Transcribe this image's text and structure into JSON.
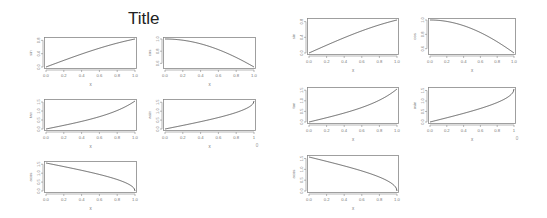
{
  "chart_data": [
    {
      "figure": "left",
      "title": "Title",
      "layout": "3x2 grid of small line plots (5 panels)",
      "panels": [
        {
          "type": "line",
          "xlabel": "x",
          "ylabel": "sin",
          "function": "sin(x)",
          "xlim": [
            0,
            1
          ],
          "ylim": [
            0,
            0.84
          ],
          "xticks": [
            "0.0",
            "0.2",
            "0.4",
            "0.6",
            "0.8",
            "1.0"
          ],
          "yticks": [
            "0.0",
            "0.4",
            "0.8"
          ],
          "x": [
            0,
            0.2,
            0.4,
            0.6,
            0.8,
            1.0
          ],
          "y": [
            0,
            0.199,
            0.389,
            0.565,
            0.717,
            0.841
          ]
        },
        {
          "type": "line",
          "xlabel": "x",
          "ylabel": "cos",
          "function": "cos(x)",
          "xlim": [
            0,
            1
          ],
          "ylim": [
            0.54,
            1
          ],
          "xticks": [
            "0.0",
            "0.2",
            "0.4",
            "0.6",
            "0.8",
            "1.0"
          ],
          "yticks": [
            "0.6",
            "0.8",
            "1.0"
          ],
          "x": [
            0,
            0.2,
            0.4,
            0.6,
            0.8,
            1.0
          ],
          "y": [
            1,
            0.98,
            0.921,
            0.825,
            0.697,
            0.54
          ]
        },
        {
          "type": "line",
          "xlabel": "x",
          "ylabel": "tan",
          "function": "tan(x)",
          "xlim": [
            0,
            1
          ],
          "ylim": [
            0,
            1.56
          ],
          "xticks": [
            "0.0",
            "0.2",
            "0.4",
            "0.6",
            "0.8",
            "1.0"
          ],
          "yticks": [
            "0.0",
            "0.5",
            "1.0",
            "1.5"
          ],
          "x": [
            0,
            0.2,
            0.4,
            0.6,
            0.8,
            1.0
          ],
          "y": [
            0,
            0.203,
            0.423,
            0.684,
            1.03,
            1.557
          ]
        },
        {
          "type": "line",
          "xlabel": "x",
          "ylabel": "asin",
          "function": "asin(x)",
          "xlim": [
            0,
            1
          ],
          "ylim": [
            0,
            1.57
          ],
          "xticks": [
            "0.0",
            "0.2",
            "0.4",
            "0.6",
            "0.8",
            "1"
          ],
          "yticks": [
            "0.0",
            "0.5",
            "1.0",
            "1.5"
          ],
          "x": [
            0,
            0.2,
            0.4,
            0.6,
            0.8,
            0.95,
            1.0
          ],
          "y": [
            0,
            0.201,
            0.412,
            0.644,
            0.927,
            1.253,
            1.571
          ],
          "annotation": "0"
        },
        {
          "type": "line",
          "xlabel": "x",
          "ylabel": "acos",
          "function": "acos(x)",
          "xlim": [
            0,
            1
          ],
          "ylim": [
            0,
            1.57
          ],
          "xticks": [
            "0.0",
            "0.2",
            "0.4",
            "0.6",
            "0.8",
            "1.0"
          ],
          "yticks": [
            "0.0",
            "0.5",
            "1.0",
            "1.5"
          ],
          "x": [
            0,
            0.2,
            0.4,
            0.6,
            0.8,
            0.95,
            1.0
          ],
          "y": [
            1.571,
            1.369,
            1.159,
            0.927,
            0.644,
            0.318,
            0
          ]
        }
      ]
    },
    {
      "figure": "right",
      "title": "",
      "layout": "3x2 grid of small line plots (5 panels)",
      "panels": [
        {
          "type": "line",
          "xlabel": "x",
          "ylabel": "sin",
          "function": "sin(x)"
        },
        {
          "type": "line",
          "xlabel": "x",
          "ylabel": "cos",
          "function": "cos(x)"
        },
        {
          "type": "line",
          "xlabel": "x",
          "ylabel": "tan",
          "function": "tan(x)"
        },
        {
          "type": "line",
          "xlabel": "x",
          "ylabel": "asin",
          "function": "asin(x)",
          "annotation": "0"
        },
        {
          "type": "line",
          "xlabel": "x",
          "ylabel": "acos",
          "function": "acos(x)"
        }
      ]
    }
  ],
  "left": {
    "title": "Title",
    "panels": [
      {
        "ylabel": "sin",
        "xlabel": "x",
        "fn": "sin",
        "ymin": 0,
        "ymax": 0.8415,
        "yticks": [
          [
            0,
            "0.0"
          ],
          [
            0.4,
            "0.4"
          ],
          [
            0.8,
            "0.8"
          ]
        ],
        "xticks": [
          "0.0",
          "0.2",
          "0.4",
          "0.6",
          "0.8",
          "1.0"
        ],
        "x": 44,
        "y": 37,
        "w": 93,
        "h": 32,
        "annot": ""
      },
      {
        "ylabel": "cos",
        "xlabel": "x",
        "fn": "cos",
        "ymin": 0.5403,
        "ymax": 1,
        "yticks": [
          [
            0.6,
            "0.6"
          ],
          [
            0.8,
            "0.8"
          ],
          [
            1.0,
            "1.0"
          ]
        ],
        "xticks": [
          "0.0",
          "0.2",
          "0.4",
          "0.6",
          "0.8",
          "1.0"
        ],
        "x": 163,
        "y": 37,
        "w": 93,
        "h": 32,
        "annot": ""
      },
      {
        "ylabel": "tan",
        "xlabel": "x",
        "fn": "tan",
        "ymin": 0,
        "ymax": 1.5574,
        "yticks": [
          [
            0,
            "0.0"
          ],
          [
            0.5,
            "0.5"
          ],
          [
            1.0,
            "1.0"
          ],
          [
            1.5,
            "1.5"
          ]
        ],
        "xticks": [
          "0.0",
          "0.2",
          "0.4",
          "0.6",
          "0.8",
          "1.0"
        ],
        "x": 44,
        "y": 99,
        "w": 93,
        "h": 32,
        "annot": ""
      },
      {
        "ylabel": "asin",
        "xlabel": "x",
        "fn": "asin",
        "ymin": 0,
        "ymax": 1.5708,
        "yticks": [
          [
            0,
            "0.0"
          ],
          [
            0.5,
            "0.5"
          ],
          [
            1.0,
            "1.0"
          ],
          [
            1.5,
            "1.5"
          ]
        ],
        "xticks": [
          "0.0",
          "0.2",
          "0.4",
          "0.6",
          "0.8",
          "1"
        ],
        "x": 163,
        "y": 99,
        "w": 93,
        "h": 32,
        "annot": "0"
      },
      {
        "ylabel": "acos",
        "xlabel": "x",
        "fn": "acos",
        "ymin": 0,
        "ymax": 1.5708,
        "yticks": [
          [
            0,
            "0.0"
          ],
          [
            0.5,
            "0.5"
          ],
          [
            1.0,
            "1.0"
          ],
          [
            1.5,
            "1.5"
          ]
        ],
        "xticks": [
          "0.0",
          "0.2",
          "0.4",
          "0.6",
          "0.8",
          "1.0"
        ],
        "x": 44,
        "y": 161,
        "w": 93,
        "h": 32,
        "annot": ""
      }
    ]
  },
  "right": {
    "panels": [
      {
        "ylabel": "sin",
        "xlabel": "x",
        "fn": "sin",
        "ymin": 0,
        "ymax": 0.8415,
        "yticks": [
          [
            0,
            "0.0"
          ],
          [
            0.4,
            "0.4"
          ],
          [
            0.8,
            "0.8"
          ]
        ],
        "xticks": [
          "0.0",
          "0.2",
          "0.4",
          "0.6",
          "0.8",
          "1.0"
        ],
        "x": 307,
        "y": 18,
        "w": 92,
        "h": 37,
        "annot": ""
      },
      {
        "ylabel": "cos",
        "xlabel": "x",
        "fn": "cos",
        "ymin": 0.5403,
        "ymax": 1,
        "yticks": [
          [
            0.6,
            "0.6"
          ],
          [
            0.8,
            "0.8"
          ],
          [
            1.0,
            "1.0"
          ]
        ],
        "xticks": [
          "0.0",
          "0.2",
          "0.4",
          "0.6",
          "0.8",
          "1.0"
        ],
        "x": 428,
        "y": 18,
        "w": 88,
        "h": 37,
        "annot": ""
      },
      {
        "ylabel": "tan",
        "xlabel": "x",
        "fn": "tan",
        "ymin": 0,
        "ymax": 1.5574,
        "yticks": [
          [
            0,
            "0.0"
          ],
          [
            0.5,
            "0.5"
          ],
          [
            1.0,
            "1.0"
          ],
          [
            1.5,
            "1.5"
          ]
        ],
        "xticks": [
          "0.0",
          "0.2",
          "0.4",
          "0.6",
          "0.8",
          "1.0"
        ],
        "x": 307,
        "y": 87,
        "w": 92,
        "h": 37,
        "annot": ""
      },
      {
        "ylabel": "asin",
        "xlabel": "x",
        "fn": "asin",
        "ymin": 0,
        "ymax": 1.5708,
        "yticks": [
          [
            0,
            "0.0"
          ],
          [
            0.5,
            "0.5"
          ],
          [
            1.0,
            "1.0"
          ],
          [
            1.5,
            "1.5"
          ]
        ],
        "xticks": [
          "0.0",
          "0.2",
          "0.4",
          "0.6",
          "0.8",
          "1"
        ],
        "x": 428,
        "y": 87,
        "w": 88,
        "h": 37,
        "annot": "0"
      },
      {
        "ylabel": "acos",
        "xlabel": "x",
        "fn": "acos",
        "ymin": 0,
        "ymax": 1.5708,
        "yticks": [
          [
            0,
            "0.0"
          ],
          [
            0.5,
            "0.5"
          ],
          [
            1.0,
            "1.0"
          ],
          [
            1.5,
            "1.5"
          ]
        ],
        "xticks": [
          "0.0",
          "0.2",
          "0.4",
          "0.6",
          "0.8",
          "1.0"
        ],
        "x": 307,
        "y": 155,
        "w": 92,
        "h": 38,
        "annot": ""
      }
    ]
  },
  "colors": {
    "line": "#555555",
    "axis": "#888888",
    "text": "#777777",
    "background": "#ffffff"
  }
}
